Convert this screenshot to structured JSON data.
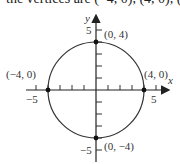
{
  "top_text": "the vertices are (−4, 0), (4, 0), (",
  "chart_data": {
    "type": "scatter",
    "title": "",
    "xlabel": "x",
    "ylabel": "y",
    "xlim": [
      -5.5,
      5.5
    ],
    "ylim": [
      -5.5,
      5.5
    ],
    "grid": false,
    "curve": {
      "shape": "circle",
      "center": [
        0,
        0
      ],
      "radius": 4,
      "equation": "x^2 + y^2 = 16"
    },
    "points": [
      {
        "x": 0,
        "y": 4,
        "label": "(0, 4)"
      },
      {
        "x": -4,
        "y": 0,
        "label": "(−4, 0)"
      },
      {
        "x": 4,
        "y": 0,
        "label": "(4, 0)"
      },
      {
        "x": 0,
        "y": -4,
        "label": "(0, −4)"
      }
    ],
    "x_ticks": [
      -5,
      -4,
      -3,
      -2,
      -1,
      1,
      2,
      3,
      4,
      5
    ],
    "y_ticks": [
      -5,
      -4,
      -3,
      -2,
      -1,
      1,
      2,
      3,
      4,
      5
    ],
    "x_tick_labels": {
      "-5": "−5",
      "5": "5"
    },
    "y_tick_labels": {
      "5": "5",
      "-5": "−5"
    }
  },
  "labels": {
    "x_axis": "x",
    "y_axis": "y",
    "p_top": "(0, 4)",
    "p_left": "(−4, 0)",
    "p_right": "(4, 0)",
    "p_bottom": "(0, −4)",
    "tick_x_neg5": "−5",
    "tick_x_pos5": "5",
    "tick_y_pos5": "5",
    "tick_y_neg5": "−5"
  }
}
